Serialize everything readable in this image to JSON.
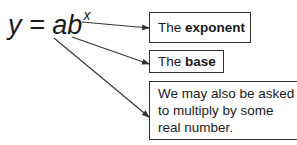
{
  "formula": {
    "lhs": "y",
    "equals": "=",
    "a": "a",
    "b": "b",
    "exponent": "x"
  },
  "callouts": [
    {
      "prefix": "The ",
      "bold": "exponent",
      "target": "exponent"
    },
    {
      "prefix": "The ",
      "bold": "base",
      "target": "b"
    },
    {
      "text": "We may also be asked to multiply by some real number.",
      "target": "a"
    }
  ],
  "colors": {
    "stroke": "#333333",
    "text": "#1a1a1a",
    "background": "#ffffff"
  }
}
